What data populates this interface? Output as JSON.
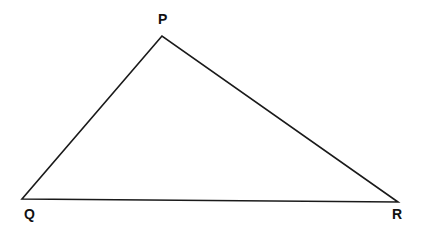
{
  "diagram": {
    "type": "triangle",
    "stroke_color": "#1a1a1a",
    "background": "#ffffff",
    "vertices": [
      {
        "label": "P",
        "x": 162,
        "y": 36
      },
      {
        "label": "Q",
        "x": 22,
        "y": 199
      },
      {
        "label": "R",
        "x": 398,
        "y": 202
      }
    ],
    "labels": {
      "P": "P",
      "Q": "Q",
      "R": "R"
    }
  }
}
